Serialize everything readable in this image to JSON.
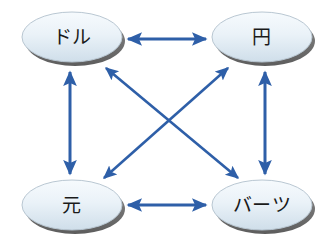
{
  "diagram": {
    "background_color": "#ffffff",
    "width": 336,
    "height": 249,
    "arrow_color": "#2e5fa8",
    "arrow_color_light": "#3f72bd",
    "node_fill_top": "#f2f7fb",
    "node_fill_bottom": "#d2e0ea",
    "node_border_color": "#b9c7d2",
    "node_shadow_color": "#6e6e6e",
    "node_text_color": "#1a1a1a",
    "nodes": [
      {
        "id": "dollar",
        "label": "ドル",
        "cx": 72,
        "cy": 37,
        "rx": 50,
        "ry": 25
      },
      {
        "id": "yen",
        "label": "円",
        "cx": 262,
        "cy": 37,
        "rx": 50,
        "ry": 25
      },
      {
        "id": "yuan",
        "label": "元",
        "cx": 72,
        "cy": 205,
        "rx": 50,
        "ry": 25
      },
      {
        "id": "baht",
        "label": "バーツ",
        "cx": 262,
        "cy": 205,
        "rx": 50,
        "ry": 25
      }
    ],
    "edges": [
      {
        "id": "dollar-yen",
        "from": "dollar",
        "to": "yen",
        "direction": "bidirectional",
        "x1": 128,
        "y1": 39,
        "x2": 206,
        "y2": 39
      },
      {
        "id": "yuan-baht",
        "from": "yuan",
        "to": "baht",
        "direction": "bidirectional",
        "x1": 128,
        "y1": 205,
        "x2": 206,
        "y2": 205
      },
      {
        "id": "dollar-yuan",
        "from": "dollar",
        "to": "yuan",
        "direction": "bidirectional",
        "x1": 70,
        "y1": 72,
        "x2": 70,
        "y2": 174
      },
      {
        "id": "yen-baht",
        "from": "yen",
        "to": "baht",
        "direction": "bidirectional",
        "x1": 265,
        "y1": 72,
        "x2": 265,
        "y2": 174
      },
      {
        "id": "dollar-baht",
        "from": "dollar",
        "to": "baht",
        "direction": "bidirectional",
        "x1": 106,
        "y1": 68,
        "x2": 238,
        "y2": 178
      },
      {
        "id": "yen-yuan",
        "from": "yen",
        "to": "yuan",
        "direction": "bidirectional",
        "x1": 228,
        "y1": 68,
        "x2": 104,
        "y2": 178
      }
    ]
  }
}
